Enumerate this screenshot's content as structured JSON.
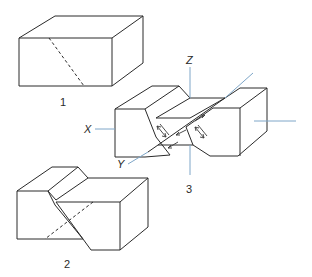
{
  "figures": [
    {
      "id": "1",
      "label": "1",
      "description": "Intact rectangular block with dashed incipient fault plane"
    },
    {
      "id": "2",
      "label": "2",
      "description": "Block displaced along inclined fault plane"
    },
    {
      "id": "3",
      "label": "3",
      "description": "Block with V-shaped fault zone and X, Y, Z axes showing shear directions"
    }
  ],
  "axes": {
    "x_label": "X",
    "y_label": "Y",
    "z_label": "Z"
  },
  "colors": {
    "line": "#2a2a2a",
    "axis": "#7ea6c8",
    "background": "#ffffff"
  }
}
